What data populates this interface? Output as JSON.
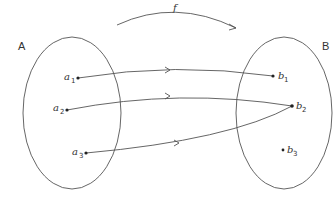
{
  "diagram": {
    "type": "function-mapping",
    "function_label": "f",
    "domain_set": {
      "label": "A",
      "elements": [
        {
          "name": "a",
          "subscript": "1"
        },
        {
          "name": "a",
          "subscript": "2"
        },
        {
          "name": "a",
          "subscript": "3"
        }
      ]
    },
    "codomain_set": {
      "label": "B",
      "elements": [
        {
          "name": "b",
          "subscript": "1"
        },
        {
          "name": "b",
          "subscript": "2"
        },
        {
          "name": "b",
          "subscript": "3"
        }
      ]
    },
    "mappings": [
      {
        "from": "a1",
        "to": "b1"
      },
      {
        "from": "a2",
        "to": "b2"
      },
      {
        "from": "a3",
        "to": "b2"
      }
    ],
    "colors": {
      "stroke": "#555555",
      "text": "#333333",
      "background": "#ffffff"
    }
  }
}
